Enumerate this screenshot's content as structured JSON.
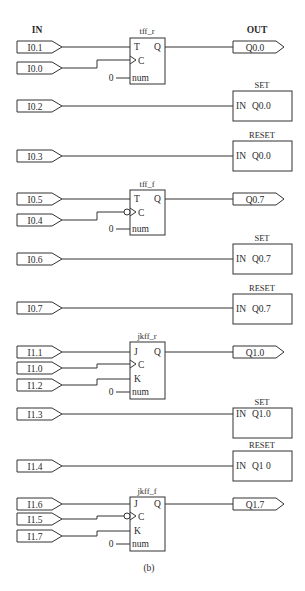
{
  "headers": {
    "in": "IN",
    "out": "OUT"
  },
  "caption": "(b)",
  "flipflops": [
    {
      "id": "tff_r",
      "label": "tff_r",
      "type": "T",
      "clock_inverted": false,
      "pins": {
        "t": "T",
        "j": "J",
        "k": "K",
        "c": "C",
        "q": "Q",
        "num": "num"
      },
      "num_const": "0",
      "inputs": {
        "data": "I0.1",
        "clock": "I0.0"
      },
      "output": "Q0.0"
    },
    {
      "id": "tff_f",
      "label": "tff_f",
      "type": "T",
      "clock_inverted": true,
      "pins": {
        "t": "T",
        "c": "C",
        "q": "Q",
        "num": "num"
      },
      "num_const": "0",
      "inputs": {
        "data": "I0.5",
        "clock": "I0.4"
      },
      "output": "Q0.7"
    },
    {
      "id": "jkff_r",
      "label": "jkff_r",
      "type": "JK",
      "clock_inverted": false,
      "pins": {
        "j": "J",
        "c": "C",
        "k": "K",
        "q": "Q",
        "num": "num"
      },
      "num_const": "0",
      "inputs": {
        "j": "I1.1",
        "clock": "I1.0",
        "k": "I1.2"
      },
      "output": "Q1.0"
    },
    {
      "id": "jkff_f",
      "label": "jkff_f",
      "type": "JK",
      "clock_inverted": true,
      "pins": {
        "j": "J",
        "c": "C",
        "k": "K",
        "q": "Q",
        "num": "num"
      },
      "num_const": "0",
      "inputs": {
        "j": "I1.6",
        "clock": "I1.5",
        "k": "I1.7"
      },
      "output": "Q1.7"
    }
  ],
  "set_reset_blocks": [
    {
      "title": "SET",
      "in_pin": "IN",
      "target": "Q0.0",
      "input": "I0.2"
    },
    {
      "title": "RESET",
      "in_pin": "IN",
      "target": "Q0.0",
      "input": "I0.3"
    },
    {
      "title": "SET",
      "in_pin": "IN",
      "target": "Q0.7",
      "input": "I0.6"
    },
    {
      "title": "RESET",
      "in_pin": "IN",
      "target": "Q0.7",
      "input": "I0.7"
    },
    {
      "title": "SET",
      "in_pin": "IN",
      "target": "Q1.0",
      "input": "I1.3"
    },
    {
      "title": "RESET",
      "in_pin": "IN",
      "target": "Q1 0",
      "input": "I1.4"
    }
  ]
}
